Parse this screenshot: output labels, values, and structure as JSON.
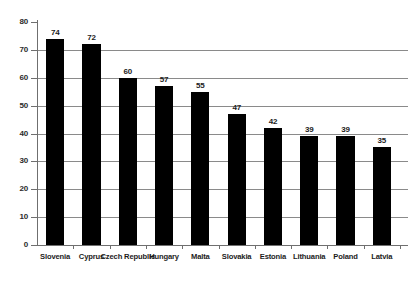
{
  "chart_data": {
    "type": "bar",
    "title": "",
    "subtitle": "",
    "xlabel": "",
    "ylabel": "percentage",
    "ylim": [
      0,
      80
    ],
    "ytick_step": 10,
    "yticks": [
      0,
      10,
      20,
      30,
      40,
      50,
      60,
      70,
      80
    ],
    "grid": true,
    "grid_axis": "y",
    "legend": false,
    "categories": [
      "Slovenia",
      "Cyprus",
      "Czech Republic",
      "Hungary",
      "Malta",
      "Slovakia",
      "Estonia",
      "Lithuania",
      "Poland",
      "Latvia"
    ],
    "values": [
      74,
      72,
      60,
      57,
      55,
      47,
      42,
      39,
      39,
      35
    ],
    "data_labels": [
      "74",
      "72",
      "60",
      "57",
      "55",
      "47",
      "42",
      "39",
      "39",
      "35"
    ],
    "bar_color": "#000000",
    "grid_color": "#8a8a8a",
    "axis_color": "#6f6f6f",
    "background_color": "#ffffff"
  }
}
